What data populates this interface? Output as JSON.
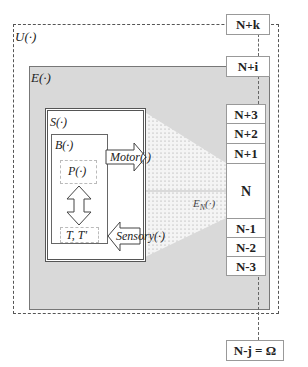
{
  "labels": {
    "universe": "U(·)",
    "environment": "E(·)",
    "system": "S(·)",
    "body": "B(·)",
    "policy": "P(·)",
    "transitions": "T, T'",
    "motor": "Motor(·)",
    "sensory": "Sensory(·)",
    "env_n": "E",
    "env_n_sub": "N",
    "env_n_suffix": "(·)"
  },
  "levels": {
    "top": "N+k",
    "upper": "N+i",
    "stack": [
      "N+3",
      "N+2",
      "N+1",
      "N",
      "N-1",
      "N-2",
      "N-3"
    ],
    "bottom": "N-j = Ω"
  },
  "colors": {
    "environment_fill": "#d9d9d9",
    "border": "#555555",
    "stipple": "#9a9a9a"
  }
}
